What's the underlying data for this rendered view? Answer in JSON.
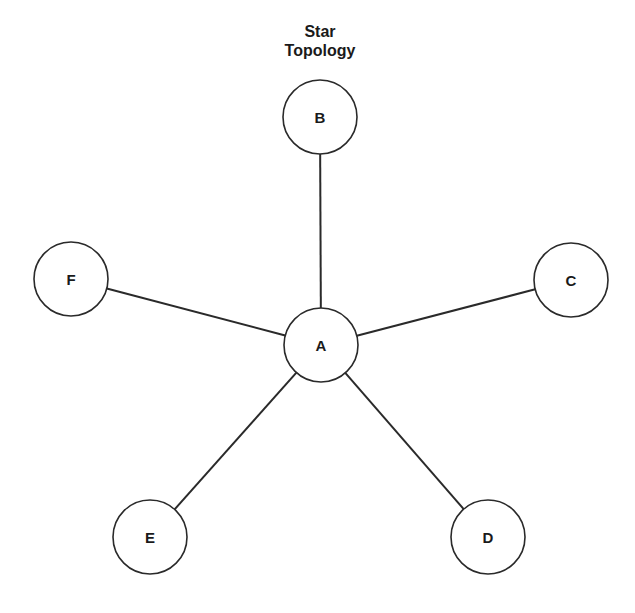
{
  "title": {
    "line1": "Star",
    "line2": "Topology"
  },
  "style": {
    "stroke": "#2a2a2a",
    "fill": "#ffffff",
    "text": "#1a1a1a"
  },
  "nodes": [
    {
      "id": "A",
      "label": "A",
      "x": 321,
      "y": 345,
      "r": 37,
      "role": "hub"
    },
    {
      "id": "B",
      "label": "B",
      "x": 320,
      "y": 117,
      "r": 37
    },
    {
      "id": "C",
      "label": "C",
      "x": 571,
      "y": 280,
      "r": 37
    },
    {
      "id": "D",
      "label": "D",
      "x": 488,
      "y": 537,
      "r": 37
    },
    {
      "id": "E",
      "label": "E",
      "x": 150,
      "y": 537,
      "r": 37
    },
    {
      "id": "F",
      "label": "F",
      "x": 71,
      "y": 279,
      "r": 37
    }
  ],
  "edges": [
    {
      "from": "A",
      "to": "B"
    },
    {
      "from": "A",
      "to": "C"
    },
    {
      "from": "A",
      "to": "D"
    },
    {
      "from": "A",
      "to": "E"
    },
    {
      "from": "A",
      "to": "F"
    }
  ]
}
